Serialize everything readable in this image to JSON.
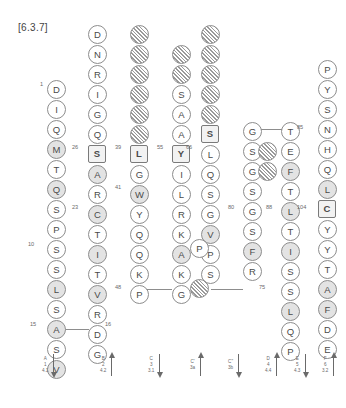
{
  "figure": {
    "label": "[6.3.7]"
  },
  "strands": [
    {
      "id": "strand-a",
      "name": "A",
      "x": 47,
      "y_top": 80,
      "direction": "down",
      "residues": [
        {
          "aa": "D",
          "style": "plain"
        },
        {
          "aa": "I",
          "style": "plain"
        },
        {
          "aa": "Q",
          "style": "plain"
        },
        {
          "aa": "M",
          "style": "shade"
        },
        {
          "aa": "T",
          "style": "plain"
        },
        {
          "aa": "Q",
          "style": "shade"
        },
        {
          "aa": "S",
          "style": "plain"
        },
        {
          "aa": "P",
          "style": "plain"
        },
        {
          "aa": "S",
          "style": "plain"
        },
        {
          "aa": "S",
          "style": "plain"
        },
        {
          "aa": "L",
          "style": "shade"
        },
        {
          "aa": "S",
          "style": "plain"
        },
        {
          "aa": "A",
          "style": "shade"
        },
        {
          "aa": "S",
          "style": "plain"
        },
        {
          "aa": "V",
          "style": "shade"
        }
      ]
    },
    {
      "id": "strand-b",
      "name": "B",
      "x": 88,
      "y_top": 25,
      "direction": "down",
      "residues": [
        {
          "aa": "D",
          "style": "plain"
        },
        {
          "aa": "N",
          "style": "plain"
        },
        {
          "aa": "R",
          "style": "plain"
        },
        {
          "aa": "I",
          "style": "plain"
        },
        {
          "aa": "G",
          "style": "plain"
        },
        {
          "aa": "Q",
          "style": "plain"
        },
        {
          "aa": "S",
          "style": "box"
        },
        {
          "aa": "A",
          "style": "shade"
        },
        {
          "aa": "R",
          "style": "plain"
        },
        {
          "aa": "C",
          "style": "shade"
        },
        {
          "aa": "T",
          "style": "plain"
        },
        {
          "aa": "I",
          "style": "shade"
        },
        {
          "aa": "T",
          "style": "plain"
        },
        {
          "aa": "V",
          "style": "shade"
        },
        {
          "aa": "R",
          "style": "plain"
        },
        {
          "aa": "D",
          "style": "plain"
        },
        {
          "aa": "G",
          "style": "plain"
        }
      ]
    },
    {
      "id": "strand-c",
      "name": "C",
      "x": 130,
      "y_top": 25,
      "direction": "up",
      "residues": [
        {
          "aa": "",
          "style": "hatch"
        },
        {
          "aa": "",
          "style": "hatch"
        },
        {
          "aa": "",
          "style": "hatch"
        },
        {
          "aa": "",
          "style": "hatch"
        },
        {
          "aa": "",
          "style": "hatch"
        },
        {
          "aa": "",
          "style": "hatch"
        },
        {
          "aa": "L",
          "style": "box"
        },
        {
          "aa": "G",
          "style": "plain"
        },
        {
          "aa": "W",
          "style": "shade"
        },
        {
          "aa": "Y",
          "style": "plain"
        },
        {
          "aa": "Q",
          "style": "plain"
        },
        {
          "aa": "Q",
          "style": "plain"
        },
        {
          "aa": "K",
          "style": "plain"
        },
        {
          "aa": "P",
          "style": "plain"
        }
      ]
    },
    {
      "id": "strand-c-prime",
      "name": "C'",
      "x": 172,
      "y_top": 45,
      "direction": "up",
      "residues": [
        {
          "aa": "",
          "style": "hatch"
        },
        {
          "aa": "",
          "style": "hatch"
        },
        {
          "aa": "S",
          "style": "plain"
        },
        {
          "aa": "A",
          "style": "plain"
        },
        {
          "aa": "A",
          "style": "plain"
        },
        {
          "aa": "Y",
          "style": "box"
        },
        {
          "aa": "I",
          "style": "plain"
        },
        {
          "aa": "L",
          "style": "plain"
        },
        {
          "aa": "R",
          "style": "plain"
        },
        {
          "aa": "K",
          "style": "plain"
        },
        {
          "aa": "A",
          "style": "shade"
        },
        {
          "aa": "K",
          "style": "plain"
        },
        {
          "aa": "G",
          "style": "plain"
        }
      ]
    },
    {
      "id": "strand-c-double-prime",
      "name": "C\"",
      "x": 201,
      "y_top": 25,
      "direction": "down",
      "residues": [
        {
          "aa": "",
          "style": "hatch"
        },
        {
          "aa": "",
          "style": "hatch"
        },
        {
          "aa": "",
          "style": "hatch"
        },
        {
          "aa": "",
          "style": "hatch"
        },
        {
          "aa": "",
          "style": "hatch"
        },
        {
          "aa": "S",
          "style": "box"
        },
        {
          "aa": "L",
          "style": "plain"
        },
        {
          "aa": "Q",
          "style": "plain"
        },
        {
          "aa": "S",
          "style": "plain"
        },
        {
          "aa": "G",
          "style": "plain"
        },
        {
          "aa": "V",
          "style": "shade"
        },
        {
          "aa": "P",
          "style": "plain"
        },
        {
          "aa": "S",
          "style": "plain"
        }
      ]
    },
    {
      "id": "strand-d",
      "name": "D",
      "x": 243,
      "y_top": 122,
      "direction": "up",
      "residues": [
        {
          "aa": "G",
          "style": "plain"
        },
        {
          "aa": "S",
          "style": "plain"
        },
        {
          "aa": "G",
          "style": "plain"
        },
        {
          "aa": "S",
          "style": "plain"
        },
        {
          "aa": "G",
          "style": "plain"
        },
        {
          "aa": "S",
          "style": "plain"
        },
        {
          "aa": "F",
          "style": "shade"
        },
        {
          "aa": "R",
          "style": "plain"
        }
      ]
    },
    {
      "id": "strand-e",
      "name": "E",
      "x": 281,
      "y_top": 122,
      "direction": "down",
      "residues": [
        {
          "aa": "T",
          "style": "plain"
        },
        {
          "aa": "E",
          "style": "plain"
        },
        {
          "aa": "F",
          "style": "shade"
        },
        {
          "aa": "T",
          "style": "plain"
        },
        {
          "aa": "L",
          "style": "shade"
        },
        {
          "aa": "T",
          "style": "plain"
        },
        {
          "aa": "I",
          "style": "shade"
        },
        {
          "aa": "S",
          "style": "plain"
        },
        {
          "aa": "S",
          "style": "plain"
        },
        {
          "aa": "L",
          "style": "shade"
        },
        {
          "aa": "Q",
          "style": "plain"
        },
        {
          "aa": "P",
          "style": "plain"
        }
      ]
    },
    {
      "id": "strand-f",
      "name": "F",
      "x": 318,
      "y_top": 60,
      "direction": "up",
      "residues": [
        {
          "aa": "P",
          "style": "plain"
        },
        {
          "aa": "Y",
          "style": "plain"
        },
        {
          "aa": "S",
          "style": "plain"
        },
        {
          "aa": "N",
          "style": "plain"
        },
        {
          "aa": "H",
          "style": "plain"
        },
        {
          "aa": "Q",
          "style": "plain"
        },
        {
          "aa": "L",
          "style": "shade"
        },
        {
          "aa": "C",
          "style": "box"
        },
        {
          "aa": "Y",
          "style": "plain"
        },
        {
          "aa": "Y",
          "style": "plain"
        },
        {
          "aa": "T",
          "style": "plain"
        },
        {
          "aa": "A",
          "style": "shade"
        },
        {
          "aa": "F",
          "style": "shade"
        },
        {
          "aa": "D",
          "style": "plain"
        },
        {
          "aa": "E",
          "style": "plain"
        }
      ]
    }
  ],
  "offset_residues": [
    {
      "id": "bulge-p-cprime",
      "aa": "P",
      "style": "plain",
      "x": 190,
      "y": 239
    },
    {
      "id": "bulge-hatch-cdouble",
      "aa": "",
      "style": "hatch",
      "x": 190,
      "y": 279
    },
    {
      "id": "bulge-hatch-d-upper",
      "aa": "",
      "style": "hatch",
      "x": 258,
      "y": 142
    },
    {
      "id": "bulge-hatch-d-lower",
      "aa": "",
      "style": "hatch",
      "x": 258,
      "y": 162
    }
  ],
  "numbers": [
    {
      "id": "num-1",
      "text": "1",
      "x": 40,
      "y": 82
    },
    {
      "id": "num-10",
      "text": "10",
      "x": 28,
      "y": 242
    },
    {
      "id": "num-15",
      "text": "15",
      "x": 30,
      "y": 322
    },
    {
      "id": "num-16",
      "text": "16",
      "x": 105,
      "y": 322
    },
    {
      "id": "num-23",
      "text": "23",
      "x": 72,
      "y": 205
    },
    {
      "id": "num-26",
      "text": "26",
      "x": 72,
      "y": 145
    },
    {
      "id": "num-39",
      "text": "39",
      "x": 115,
      "y": 145
    },
    {
      "id": "num-41",
      "text": "41",
      "x": 115,
      "y": 185
    },
    {
      "id": "num-48",
      "text": "48",
      "x": 115,
      "y": 285
    },
    {
      "id": "num-55",
      "text": "55",
      "x": 157,
      "y": 145
    },
    {
      "id": "num-66",
      "text": "66",
      "x": 186,
      "y": 145
    },
    {
      "id": "num-75",
      "text": "75",
      "x": 259,
      "y": 285
    },
    {
      "id": "num-80",
      "text": "80",
      "x": 228,
      "y": 205
    },
    {
      "id": "num-85",
      "text": "85",
      "x": 297,
      "y": 125
    },
    {
      "id": "num-88",
      "text": "88",
      "x": 266,
      "y": 205
    },
    {
      "id": "num-104",
      "text": "104",
      "x": 297,
      "y": 205
    }
  ],
  "links": [
    {
      "id": "link-a-b",
      "x": 57,
      "y": 329,
      "w": 32
    },
    {
      "id": "link-c-cp",
      "x": 140,
      "y": 289,
      "w": 32
    },
    {
      "id": "link-cd-d",
      "x": 211,
      "y": 289,
      "w": 32
    },
    {
      "id": "link-d-e",
      "x": 253,
      "y": 129,
      "w": 29
    }
  ],
  "legend": {
    "items": [
      {
        "id": "legend-a",
        "letter": "A",
        "num": "1",
        "code": "4.1",
        "arrow": "down"
      },
      {
        "id": "legend-b",
        "letter": "B",
        "num": "2",
        "code": "4.2",
        "arrow": "up"
      },
      {
        "id": "legend-c",
        "letter": "C",
        "num": "3",
        "code": "3.1",
        "arrow": "down"
      },
      {
        "id": "legend-cp",
        "letter": "C'",
        "num": "3a",
        "code": "",
        "arrow": "up"
      },
      {
        "id": "legend-cd",
        "letter": "C\"",
        "num": "3b",
        "code": "",
        "arrow": "down"
      },
      {
        "id": "legend-d",
        "letter": "D",
        "num": "4",
        "code": "4.4",
        "arrow": "up"
      },
      {
        "id": "legend-e",
        "letter": "E",
        "num": "5",
        "code": "4.3",
        "arrow": "down"
      },
      {
        "id": "legend-f",
        "letter": "F",
        "num": "6",
        "code": "3.2",
        "arrow": "up"
      }
    ],
    "x_positions": [
      42,
      100,
      148,
      190,
      228,
      265,
      294,
      322
    ],
    "y": 352
  },
  "colors": {
    "stroke": "#8d8d8d",
    "text": "#4a4a4a",
    "shade_fill": "#e3e3e3",
    "box_fill": "#f2f2f2",
    "background": "#ffffff"
  }
}
